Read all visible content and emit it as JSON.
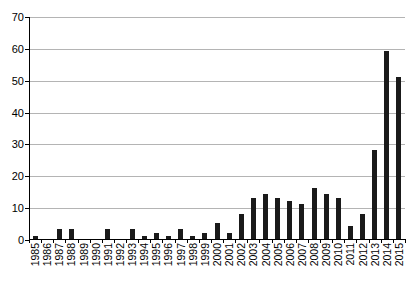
{
  "chart_data": {
    "type": "bar",
    "title": "",
    "subtitle": "",
    "xlabel": "",
    "ylabel": "",
    "ylim": [
      0,
      70
    ],
    "ytick_values": [
      0,
      10,
      20,
      30,
      40,
      50,
      60,
      70
    ],
    "ytick_labels": [
      "0",
      "10",
      "20",
      "30",
      "40",
      "50",
      "60",
      "70"
    ],
    "grid": true,
    "legend": false,
    "legend_position": "none",
    "bar_color": "#1a1a1a",
    "grid_color": "#b4b4b4",
    "axis_color": "#000000",
    "categories": [
      "1985",
      "1986",
      "1987",
      "1988",
      "1989",
      "1990",
      "1991",
      "1992",
      "1993",
      "1994",
      "1995",
      "1996",
      "1997",
      "1998",
      "1999",
      "2000",
      "2001",
      "2002",
      "2003",
      "2004",
      "2005",
      "2006",
      "2007",
      "2008",
      "2009",
      "2010",
      "2011",
      "2012",
      "2013",
      "2014",
      "2015"
    ],
    "values": [
      1,
      0,
      3,
      3,
      0,
      0,
      3,
      0,
      3,
      1,
      2,
      1,
      3,
      1,
      2,
      5,
      2,
      8,
      13,
      14,
      13,
      12,
      11,
      16,
      14,
      13,
      4,
      8,
      28,
      59,
      51
    ]
  }
}
